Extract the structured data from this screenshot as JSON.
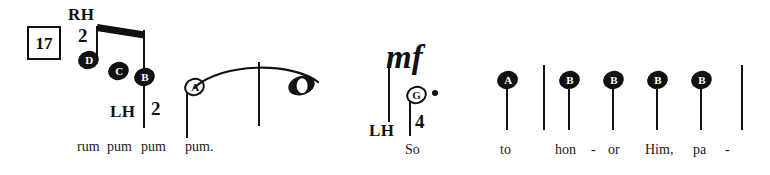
{
  "score": {
    "measure_number": "17",
    "dynamic": "mf",
    "hand_labels": {
      "right_hand": "RH",
      "left_hand": "LH"
    },
    "fingerings": {
      "rh_first": "2",
      "lh_first": "2",
      "lh_second": "4"
    },
    "notes": [
      {
        "letter": "D",
        "head": "filled"
      },
      {
        "letter": "C",
        "head": "filled"
      },
      {
        "letter": "B",
        "head": "filled"
      },
      {
        "letter": "A",
        "head": "hollow"
      },
      {
        "letter": "",
        "head": "whole"
      },
      {
        "letter": "G",
        "head": "hollow"
      },
      {
        "letter": "A",
        "head": "filled"
      },
      {
        "letter": "B",
        "head": "filled"
      },
      {
        "letter": "B",
        "head": "filled"
      },
      {
        "letter": "B",
        "head": "filled"
      },
      {
        "letter": "B",
        "head": "filled"
      }
    ],
    "lyrics_left": [
      "rum",
      "pum",
      "pum",
      "pum."
    ],
    "lyrics_right": [
      "So",
      "to",
      "hon",
      "-",
      "or",
      "Him,",
      "pa",
      "-"
    ],
    "colors": {
      "ink": "#111111",
      "paper": "#ffffff"
    }
  }
}
